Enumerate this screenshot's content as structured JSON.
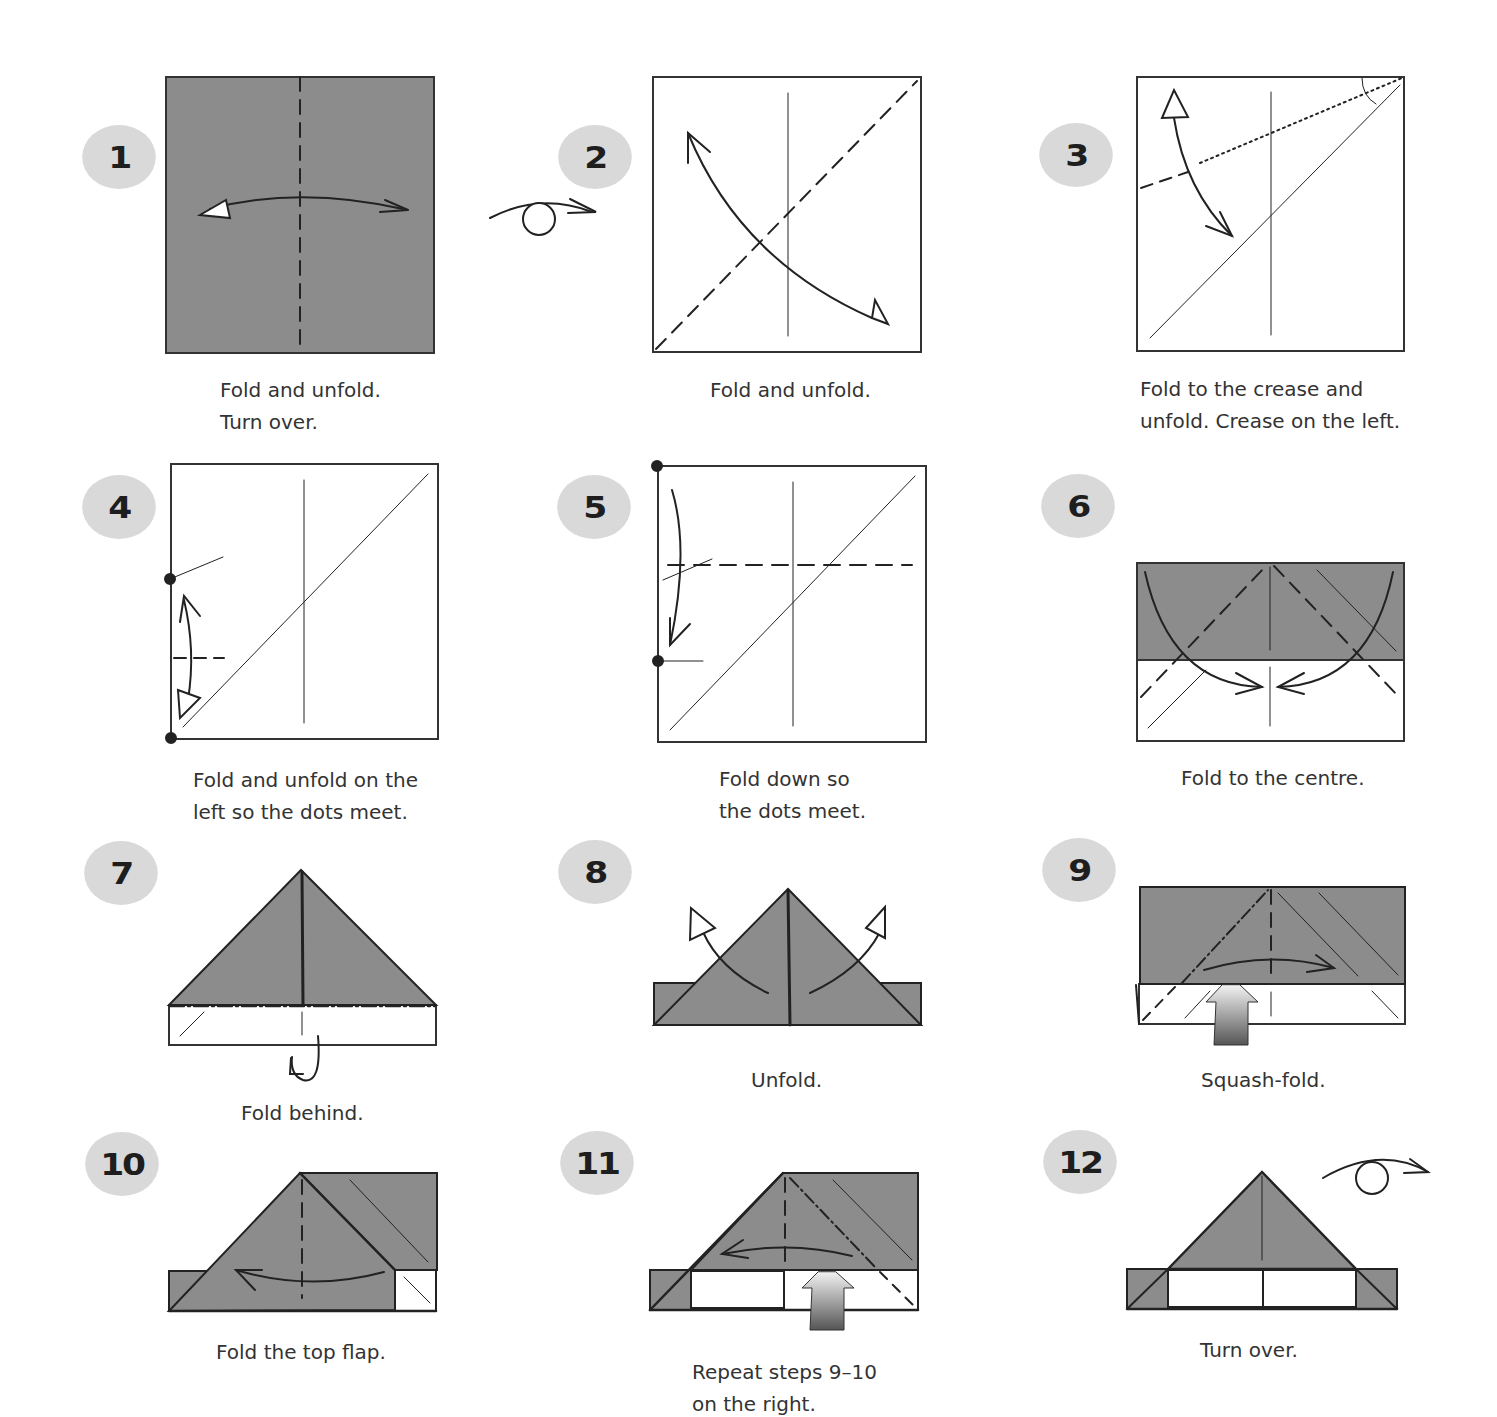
{
  "colors": {
    "paper_colored": "#8c8c8c",
    "paper_white": "#ffffff",
    "line": "#222222",
    "badge_bg": "#d9d9d9",
    "badge_text": "#1e1e1e",
    "caption_text": "#333333"
  },
  "steps": [
    {
      "number": "1",
      "caption": "Fold and unfold.\nTurn over.",
      "icons": [
        "fold-unfold-arrow-icon",
        "valley-fold-line-icon"
      ]
    },
    {
      "number": "2",
      "caption": "Fold and unfold.",
      "icons": [
        "turn-over-icon",
        "fold-unfold-arrow-icon",
        "valley-fold-line-icon"
      ]
    },
    {
      "number": "3",
      "caption": "Fold to the crease and\nunfold. Crease on the left.",
      "icons": [
        "fold-unfold-arrow-icon",
        "x-ray-line-icon"
      ]
    },
    {
      "number": "4",
      "caption": "Fold and unfold on the\nleft so the dots meet.",
      "icons": [
        "fold-unfold-arrow-icon",
        "dot-marker-icon"
      ]
    },
    {
      "number": "5",
      "caption": "Fold down so\nthe dots meet.",
      "icons": [
        "fold-arrow-icon",
        "dot-marker-icon"
      ]
    },
    {
      "number": "6",
      "caption": "Fold to the centre.",
      "icons": [
        "fold-arrow-icon"
      ]
    },
    {
      "number": "7",
      "caption": "Fold behind.",
      "icons": [
        "fold-behind-arrow-icon",
        "mountain-fold-line-icon"
      ]
    },
    {
      "number": "8",
      "caption": "Unfold.",
      "icons": [
        "unfold-arrow-icon"
      ]
    },
    {
      "number": "9",
      "caption": "Squash-fold.",
      "icons": [
        "squash-fold-arrow-icon",
        "fold-arrow-icon"
      ]
    },
    {
      "number": "10",
      "caption": "Fold the top flap.",
      "icons": [
        "fold-arrow-icon"
      ]
    },
    {
      "number": "11",
      "caption": "Repeat steps 9–10\non the right.",
      "icons": [
        "squash-fold-arrow-icon",
        "fold-arrow-icon"
      ]
    },
    {
      "number": "12",
      "caption": "Turn over.",
      "icons": [
        "turn-over-icon"
      ]
    }
  ]
}
